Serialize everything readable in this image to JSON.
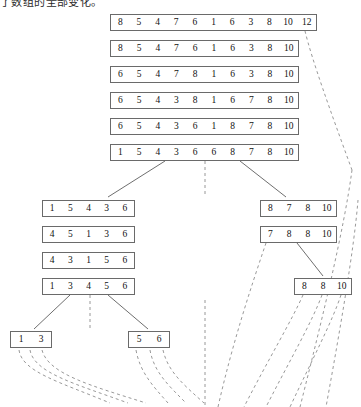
{
  "caption": {
    "text": "了数组的全部变化。"
  },
  "diagram": {
    "colors": {
      "box_border": "#6a6a6a",
      "solid_link": "#5d5d5d",
      "dashed_link": "#8d8d8d",
      "text": "#111111",
      "background": "#ffffff"
    },
    "top_stack": [
      {
        "name": "row-1",
        "values": [
          "8",
          "5",
          "4",
          "7",
          "6",
          "1",
          "6",
          "3",
          "8",
          "10",
          "12"
        ],
        "x": 110,
        "y": 14,
        "width": 207,
        "cells": 11
      },
      {
        "name": "row-2",
        "values": [
          "8",
          "5",
          "4",
          "7",
          "6",
          "1",
          "6",
          "3",
          "8",
          "10"
        ],
        "x": 110,
        "y": 40,
        "width": 189,
        "cells": 10
      },
      {
        "name": "row-3",
        "values": [
          "6",
          "5",
          "4",
          "7",
          "8",
          "1",
          "6",
          "3",
          "8",
          "10"
        ],
        "x": 110,
        "y": 66,
        "width": 189,
        "cells": 10
      },
      {
        "name": "row-4",
        "values": [
          "6",
          "5",
          "4",
          "3",
          "8",
          "1",
          "6",
          "7",
          "8",
          "10"
        ],
        "x": 110,
        "y": 92,
        "width": 189,
        "cells": 10
      },
      {
        "name": "row-5",
        "values": [
          "6",
          "5",
          "4",
          "3",
          "6",
          "1",
          "8",
          "7",
          "8",
          "10"
        ],
        "x": 110,
        "y": 118,
        "width": 189,
        "cells": 10
      },
      {
        "name": "row-6",
        "values": [
          "1",
          "5",
          "4",
          "3",
          "6",
          "6",
          "8",
          "7",
          "8",
          "10"
        ],
        "x": 110,
        "y": 144,
        "width": 189,
        "cells": 10
      }
    ],
    "left_stack": [
      {
        "name": "left-row-1",
        "values": [
          "1",
          "5",
          "4",
          "3",
          "6"
        ],
        "x": 42,
        "y": 200,
        "width": 93,
        "cells": 5
      },
      {
        "name": "left-row-2",
        "values": [
          "4",
          "5",
          "1",
          "3",
          "6"
        ],
        "x": 42,
        "y": 226,
        "width": 93,
        "cells": 5
      },
      {
        "name": "left-row-3",
        "values": [
          "4",
          "3",
          "1",
          "5",
          "6"
        ],
        "x": 42,
        "y": 252,
        "width": 93,
        "cells": 5
      },
      {
        "name": "left-row-4",
        "values": [
          "1",
          "3",
          "4",
          "5",
          "6"
        ],
        "x": 42,
        "y": 278,
        "width": 93,
        "cells": 5
      }
    ],
    "right_stack": [
      {
        "name": "right-row-1",
        "values": [
          "8",
          "7",
          "8",
          "10"
        ],
        "x": 260,
        "y": 200,
        "width": 77,
        "cells": 4
      },
      {
        "name": "right-row-2",
        "values": [
          "7",
          "8",
          "8",
          "10"
        ],
        "x": 260,
        "y": 226,
        "width": 77,
        "cells": 4
      },
      {
        "name": "right-row-3",
        "values": [
          "8",
          "8",
          "10"
        ],
        "x": 294,
        "y": 278,
        "width": 58,
        "cells": 3
      }
    ],
    "leaf_stack": [
      {
        "name": "leaf-left",
        "values": [
          "1",
          "3"
        ],
        "x": 10,
        "y": 331,
        "width": 42,
        "cells": 2
      },
      {
        "name": "leaf-right",
        "values": [
          "5",
          "6"
        ],
        "x": 128,
        "y": 331,
        "width": 42,
        "cells": 2
      }
    ],
    "solid_links": [
      {
        "name": "link-row6-to-left",
        "d": "M 165 161 L 108 197"
      },
      {
        "name": "link-row6-to-right",
        "d": "M 240 161 L 286 197"
      },
      {
        "name": "link-left4-to-leaf-left",
        "d": "M 70 295 L 34 329"
      },
      {
        "name": "link-left4-to-leaf-right",
        "d": "M 108 295 L 148 329"
      },
      {
        "name": "link-right2-to-right3",
        "d": "M 297 243 L 323 276"
      }
    ],
    "dashed_links": [
      {
        "name": "dashed-row1-trailing",
        "d": "M 305 31 C 312 60, 330 110, 352 170"
      },
      {
        "name": "dashed-center-spine",
        "d": "M 205 161 L 205 197"
      },
      {
        "name": "dashed-left4-center",
        "d": "M 90 295 L 90 330"
      },
      {
        "name": "dashed-leaf-left-a",
        "d": "M 19 350 C 22 372, 60 382, 110 403"
      },
      {
        "name": "dashed-leaf-left-b",
        "d": "M 30 350 C 34 373, 76 384, 128 403"
      },
      {
        "name": "dashed-leaf-left-c",
        "d": "M 42 350 C 48 374, 92 386, 146 403"
      },
      {
        "name": "dashed-leaf-right-a",
        "d": "M 136 350 C 140 372, 152 385, 168 403"
      },
      {
        "name": "dashed-leaf-right-b",
        "d": "M 150 350 C 154 372, 168 385, 186 403"
      },
      {
        "name": "dashed-leaf-right-c",
        "d": "M 163 350 C 168 372, 184 385, 204 403"
      },
      {
        "name": "dashed-mid-spine",
        "d": "M 205 300 L 205 407"
      },
      {
        "name": "dashed-right1-drop",
        "d": "M 266 243 C 250 290, 232 345, 218 407"
      },
      {
        "name": "dashed-right3-a",
        "d": "M 303 295 C 292 320, 268 360, 244 407"
      },
      {
        "name": "dashed-right3-b",
        "d": "M 322 295 C 312 322, 290 360, 266 407"
      },
      {
        "name": "dashed-right3-c",
        "d": "M 341 295 C 332 322, 312 360, 290 407"
      },
      {
        "name": "dashed-far-right-a",
        "d": "M 352 170 C 344 230, 322 320, 300 407"
      },
      {
        "name": "dashed-far-right-b",
        "d": "M 358 200 C 354 250, 340 330, 326 407"
      }
    ]
  }
}
